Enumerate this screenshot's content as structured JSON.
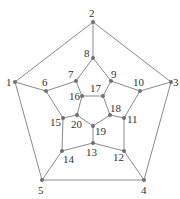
{
  "diagram": {
    "type": "graph",
    "name": "dodecahedral graph",
    "colors": {
      "edge": "#8a8a8a",
      "node": "#707070",
      "label": "#333333",
      "background": "#ffffff"
    },
    "nodes": [
      {
        "id": "1",
        "x": 15,
        "y": 82,
        "lx": 6,
        "ly": 86
      },
      {
        "id": "2",
        "x": 93,
        "y": 22,
        "lx": 89,
        "ly": 17
      },
      {
        "id": "3",
        "x": 171,
        "y": 82,
        "lx": 173,
        "ly": 86
      },
      {
        "id": "4",
        "x": 144,
        "y": 180,
        "lx": 141,
        "ly": 194
      },
      {
        "id": "5",
        "x": 42,
        "y": 180,
        "lx": 38,
        "ly": 194
      },
      {
        "id": "6",
        "x": 46,
        "y": 91,
        "lx": 42,
        "ly": 86
      },
      {
        "id": "7",
        "x": 76,
        "y": 81,
        "lx": 68,
        "ly": 78
      },
      {
        "id": "8",
        "x": 93,
        "y": 58,
        "lx": 84,
        "ly": 57
      },
      {
        "id": "9",
        "x": 111,
        "y": 81,
        "lx": 111,
        "ly": 78
      },
      {
        "id": "10",
        "x": 140,
        "y": 91,
        "lx": 133,
        "ly": 86
      },
      {
        "id": "11",
        "x": 124,
        "y": 118,
        "lx": 127,
        "ly": 123
      },
      {
        "id": "12",
        "x": 124,
        "y": 151,
        "lx": 113,
        "ly": 161
      },
      {
        "id": "13",
        "x": 93,
        "y": 143,
        "lx": 86,
        "ly": 156
      },
      {
        "id": "14",
        "x": 62,
        "y": 151,
        "lx": 63,
        "ly": 163
      },
      {
        "id": "15",
        "x": 63,
        "y": 118,
        "lx": 50,
        "ly": 126
      },
      {
        "id": "16",
        "x": 82,
        "y": 96,
        "lx": 69,
        "ly": 100
      },
      {
        "id": "17",
        "x": 103,
        "y": 96,
        "lx": 90,
        "ly": 92
      },
      {
        "id": "18",
        "x": 110,
        "y": 115,
        "lx": 110,
        "ly": 112
      },
      {
        "id": "19",
        "x": 93,
        "y": 126,
        "lx": 95,
        "ly": 135
      },
      {
        "id": "20",
        "x": 77,
        "y": 115,
        "lx": 71,
        "ly": 128
      }
    ],
    "edges": [
      [
        "1",
        "2"
      ],
      [
        "2",
        "3"
      ],
      [
        "3",
        "4"
      ],
      [
        "4",
        "5"
      ],
      [
        "5",
        "1"
      ],
      [
        "1",
        "6"
      ],
      [
        "2",
        "8"
      ],
      [
        "3",
        "10"
      ],
      [
        "4",
        "12"
      ],
      [
        "5",
        "14"
      ],
      [
        "6",
        "7"
      ],
      [
        "7",
        "8"
      ],
      [
        "8",
        "9"
      ],
      [
        "9",
        "10"
      ],
      [
        "10",
        "11"
      ],
      [
        "11",
        "12"
      ],
      [
        "12",
        "13"
      ],
      [
        "13",
        "14"
      ],
      [
        "14",
        "15"
      ],
      [
        "15",
        "6"
      ],
      [
        "7",
        "16"
      ],
      [
        "9",
        "17"
      ],
      [
        "11",
        "18"
      ],
      [
        "13",
        "19"
      ],
      [
        "15",
        "20"
      ],
      [
        "16",
        "17"
      ],
      [
        "17",
        "18"
      ],
      [
        "18",
        "19"
      ],
      [
        "19",
        "20"
      ],
      [
        "20",
        "16"
      ]
    ]
  }
}
